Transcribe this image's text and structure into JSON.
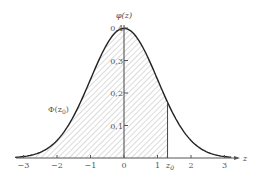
{
  "chart_data": {
    "type": "area",
    "title": "",
    "xlabel": "z",
    "ylabel": "φ(z)",
    "xlim": [
      -3.2,
      3.3
    ],
    "ylim": [
      0,
      0.4
    ],
    "x_ticks": [
      "-3",
      "-2",
      "-1",
      "0",
      "1",
      "2",
      "3"
    ],
    "x_tick_values": [
      -3,
      -2,
      -1,
      0,
      1,
      2,
      3
    ],
    "y_ticks": [
      "0,1",
      "0,2",
      "0,3",
      "0,4"
    ],
    "y_tick_values": [
      0.1,
      0.2,
      0.3,
      0.4
    ],
    "grid": false,
    "series": [
      {
        "name": "φ(z)",
        "x": [
          -3,
          -2.5,
          -2,
          -1.5,
          -1,
          -0.5,
          0,
          0.5,
          1,
          1.3,
          1.5,
          2,
          2.5,
          3
        ],
        "values": [
          0.0044,
          0.0175,
          0.054,
          0.1295,
          0.242,
          0.3521,
          0.3989,
          0.3521,
          0.242,
          0.1714,
          0.1295,
          0.054,
          0.0175,
          0.0044
        ]
      }
    ],
    "shaded_region": {
      "label": "Φ(z₀)",
      "from": -3.2,
      "to": 1.3,
      "pattern": "diagonal-hatch"
    },
    "annotations": [
      {
        "text": "z₀",
        "x": 1.3,
        "type": "vertical-line"
      },
      {
        "text": "Φ(z₀)",
        "x": -2.3,
        "y": 0.16
      }
    ]
  },
  "labels": {
    "y_axis": "φ(z)",
    "x_axis": "z",
    "z0": "z",
    "z0_sub": "0",
    "phi_label": "Φ(z",
    "phi_sub": "0",
    "phi_close": ")",
    "x_ticks": [
      "−3",
      "−2",
      "−1",
      "0",
      "1",
      "2",
      "3"
    ],
    "y_ticks": [
      "0,1",
      "0,2",
      "0,3",
      "0,4"
    ]
  }
}
